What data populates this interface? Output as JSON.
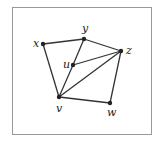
{
  "diagram": {
    "frame": {
      "x": 12,
      "y": 7,
      "width": 139,
      "height": 127
    },
    "nodes": [
      {
        "id": "x",
        "label": "x",
        "x": 43,
        "y": 44,
        "lx": 33,
        "ly": 47
      },
      {
        "id": "y",
        "label": "y",
        "x": 84,
        "y": 39,
        "lx": 82,
        "ly": 32
      },
      {
        "id": "z",
        "label": "z",
        "x": 121,
        "y": 51,
        "lx": 126,
        "ly": 54
      },
      {
        "id": "u",
        "label": "u",
        "x": 73,
        "y": 65,
        "lx": 63,
        "ly": 68
      },
      {
        "id": "v",
        "label": "v",
        "x": 59,
        "y": 97,
        "lx": 56,
        "ly": 112
      },
      {
        "id": "w",
        "label": "w",
        "x": 110,
        "y": 103,
        "lx": 107,
        "ly": 116
      }
    ],
    "edges": [
      [
        "x",
        "y"
      ],
      [
        "x",
        "v"
      ],
      [
        "y",
        "z"
      ],
      [
        "y",
        "u"
      ],
      [
        "u",
        "v"
      ],
      [
        "u",
        "z"
      ],
      [
        "v",
        "z"
      ],
      [
        "v",
        "w"
      ],
      [
        "w",
        "z"
      ]
    ],
    "colors": {
      "line": "#333333",
      "node": "#222222",
      "frame": "#999999"
    }
  }
}
